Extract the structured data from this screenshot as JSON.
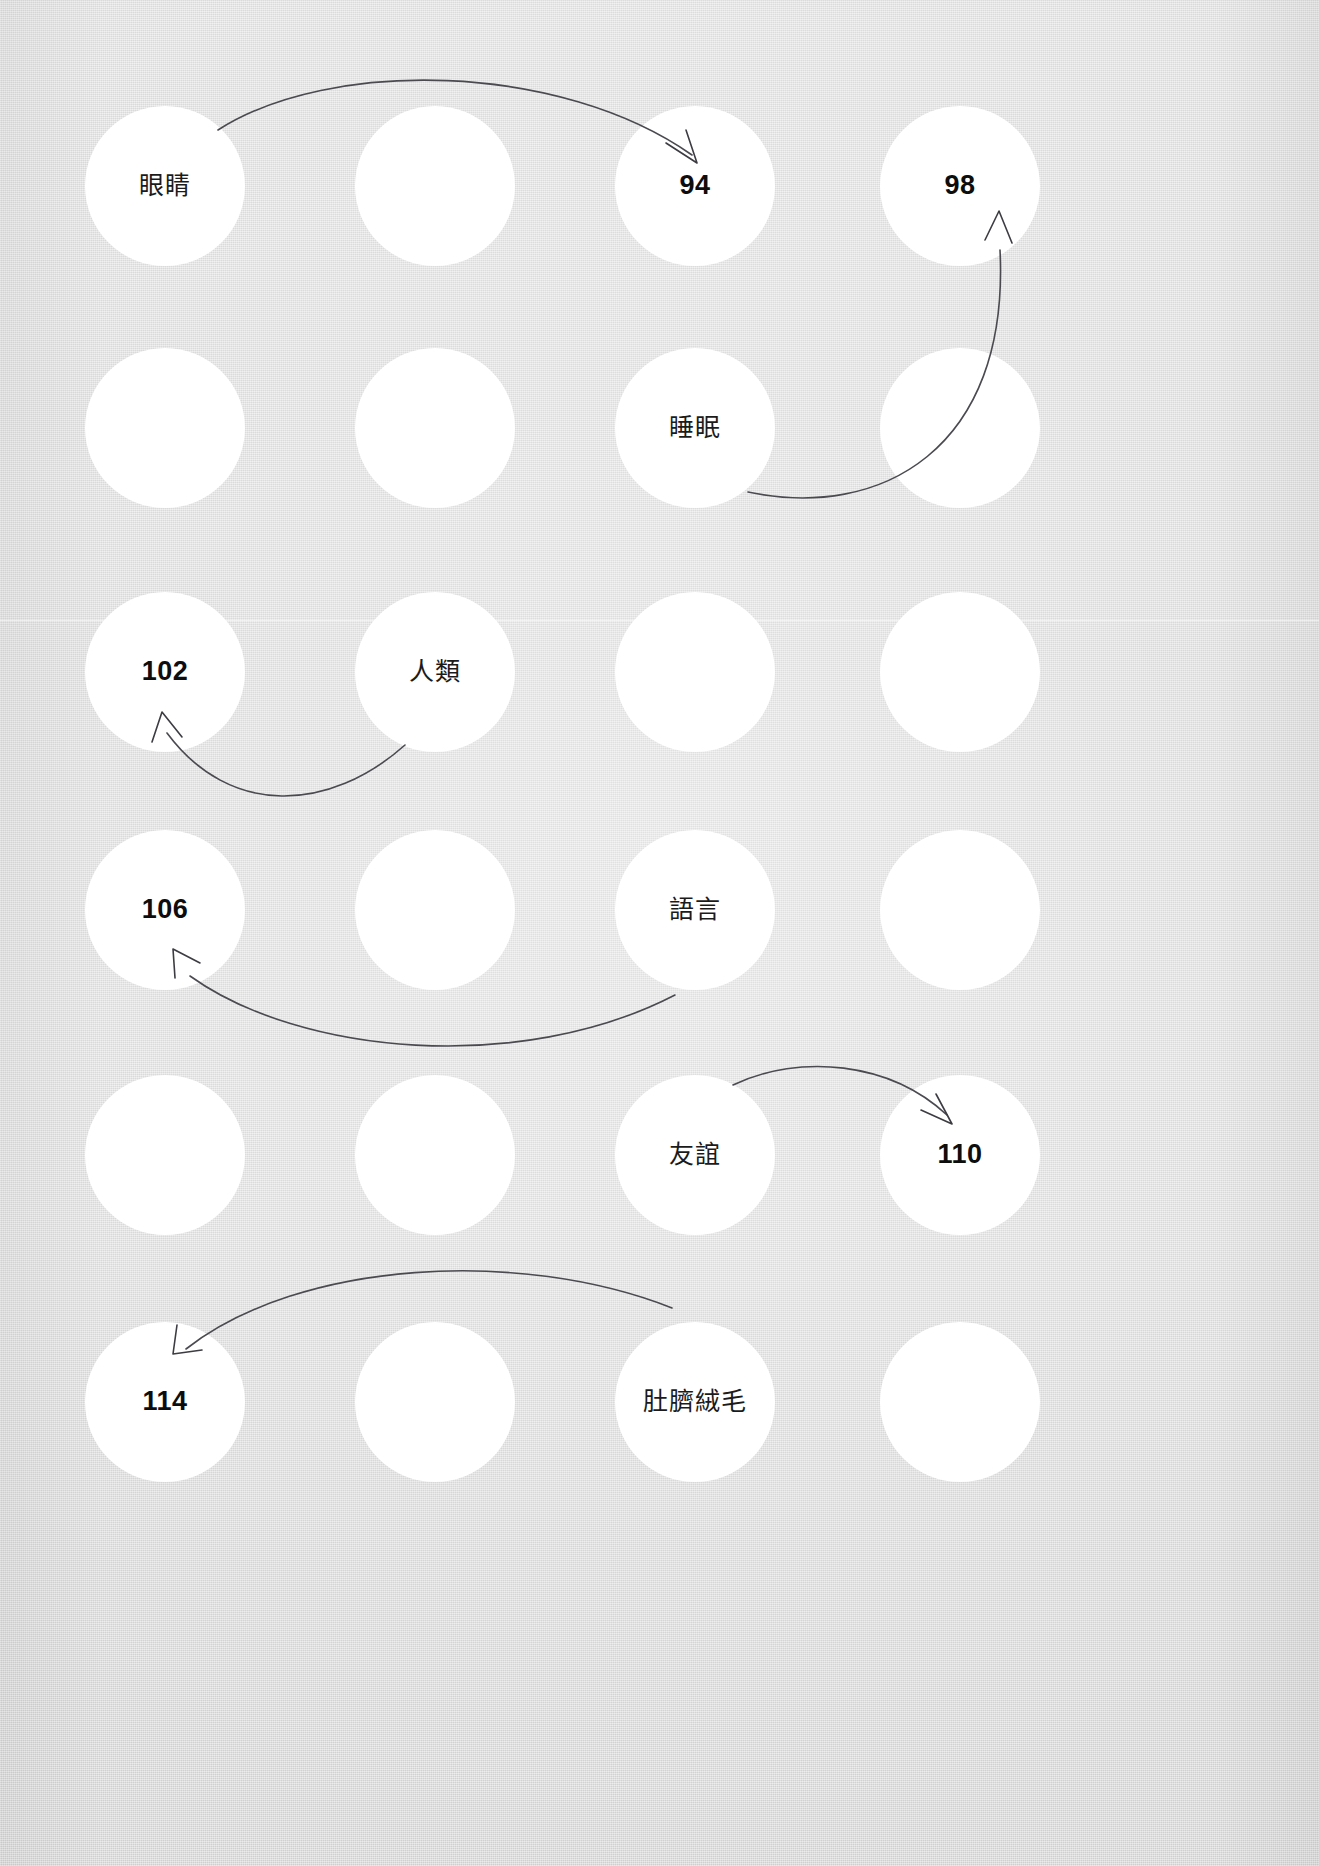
{
  "page": {
    "width": 1319,
    "height": 1866,
    "background_color": "#dcdcdc",
    "circle_color": "#ffffff",
    "text_color": "#111111",
    "arrow_color": "#4a4a50"
  },
  "grid": {
    "rows": 6,
    "columns": 4,
    "circle_diameter": 160,
    "column_centers": [
      165,
      435,
      695,
      960
    ],
    "row_centers": [
      186,
      428,
      672,
      910,
      1155,
      1402
    ]
  },
  "circles": [
    {
      "id": "r1c1",
      "row": 1,
      "col": 1,
      "cx": 165,
      "cy": 186,
      "r": 80,
      "label": "眼睛",
      "kind": "cjk"
    },
    {
      "id": "r1c2",
      "row": 1,
      "col": 2,
      "cx": 435,
      "cy": 186,
      "r": 80,
      "label": "",
      "kind": "empty"
    },
    {
      "id": "r1c3",
      "row": 1,
      "col": 3,
      "cx": 695,
      "cy": 186,
      "r": 80,
      "label": "94",
      "kind": "num"
    },
    {
      "id": "r1c4",
      "row": 1,
      "col": 4,
      "cx": 960,
      "cy": 186,
      "r": 80,
      "label": "98",
      "kind": "num"
    },
    {
      "id": "r2c1",
      "row": 2,
      "col": 1,
      "cx": 165,
      "cy": 428,
      "r": 80,
      "label": "",
      "kind": "empty"
    },
    {
      "id": "r2c2",
      "row": 2,
      "col": 2,
      "cx": 435,
      "cy": 428,
      "r": 80,
      "label": "",
      "kind": "empty"
    },
    {
      "id": "r2c3",
      "row": 2,
      "col": 3,
      "cx": 695,
      "cy": 428,
      "r": 80,
      "label": "睡眠",
      "kind": "cjk"
    },
    {
      "id": "r2c4",
      "row": 2,
      "col": 4,
      "cx": 960,
      "cy": 428,
      "r": 80,
      "label": "",
      "kind": "empty"
    },
    {
      "id": "r3c1",
      "row": 3,
      "col": 1,
      "cx": 165,
      "cy": 672,
      "r": 80,
      "label": "102",
      "kind": "num"
    },
    {
      "id": "r3c2",
      "row": 3,
      "col": 2,
      "cx": 435,
      "cy": 672,
      "r": 80,
      "label": "人類",
      "kind": "cjk"
    },
    {
      "id": "r3c3",
      "row": 3,
      "col": 3,
      "cx": 695,
      "cy": 672,
      "r": 80,
      "label": "",
      "kind": "empty"
    },
    {
      "id": "r3c4",
      "row": 3,
      "col": 4,
      "cx": 960,
      "cy": 672,
      "r": 80,
      "label": "",
      "kind": "empty"
    },
    {
      "id": "r4c1",
      "row": 4,
      "col": 1,
      "cx": 165,
      "cy": 910,
      "r": 80,
      "label": "106",
      "kind": "num"
    },
    {
      "id": "r4c2",
      "row": 4,
      "col": 2,
      "cx": 435,
      "cy": 910,
      "r": 80,
      "label": "",
      "kind": "empty"
    },
    {
      "id": "r4c3",
      "row": 4,
      "col": 3,
      "cx": 695,
      "cy": 910,
      "r": 80,
      "label": "語言",
      "kind": "cjk"
    },
    {
      "id": "r4c4",
      "row": 4,
      "col": 4,
      "cx": 960,
      "cy": 910,
      "r": 80,
      "label": "",
      "kind": "empty"
    },
    {
      "id": "r5c1",
      "row": 5,
      "col": 1,
      "cx": 165,
      "cy": 1155,
      "r": 80,
      "label": "",
      "kind": "empty"
    },
    {
      "id": "r5c2",
      "row": 5,
      "col": 2,
      "cx": 435,
      "cy": 1155,
      "r": 80,
      "label": "",
      "kind": "empty"
    },
    {
      "id": "r5c3",
      "row": 5,
      "col": 3,
      "cx": 695,
      "cy": 1155,
      "r": 80,
      "label": "友誼",
      "kind": "cjk"
    },
    {
      "id": "r5c4",
      "row": 5,
      "col": 4,
      "cx": 960,
      "cy": 1155,
      "r": 80,
      "label": "110",
      "kind": "num"
    },
    {
      "id": "r6c1",
      "row": 6,
      "col": 1,
      "cx": 165,
      "cy": 1402,
      "r": 80,
      "label": "114",
      "kind": "num"
    },
    {
      "id": "r6c2",
      "row": 6,
      "col": 2,
      "cx": 435,
      "cy": 1402,
      "r": 80,
      "label": "",
      "kind": "empty"
    },
    {
      "id": "r6c3",
      "row": 6,
      "col": 3,
      "cx": 695,
      "cy": 1402,
      "r": 80,
      "label": "肚臍絨毛",
      "kind": "cjk"
    },
    {
      "id": "r6c4",
      "row": 6,
      "col": 4,
      "cx": 960,
      "cy": 1402,
      "r": 80,
      "label": "",
      "kind": "empty"
    }
  ],
  "connections": [
    {
      "id": "a1",
      "from": "眼睛",
      "to": "94",
      "from_circle": "r1c1",
      "to_circle": "r1c3"
    },
    {
      "id": "a2",
      "from": "睡眠",
      "to": "98",
      "from_circle": "r2c3",
      "to_circle": "r1c4"
    },
    {
      "id": "a3",
      "from": "人類",
      "to": "102",
      "from_circle": "r3c2",
      "to_circle": "r3c1"
    },
    {
      "id": "a4",
      "from": "語言",
      "to": "106",
      "from_circle": "r4c3",
      "to_circle": "r4c1"
    },
    {
      "id": "a5",
      "from": "友誼",
      "to": "110",
      "from_circle": "r5c3",
      "to_circle": "r5c4"
    },
    {
      "id": "a6",
      "from": "肚臍絨毛",
      "to": "114",
      "from_circle": "r6c3",
      "to_circle": "r6c1"
    }
  ],
  "labels_summary": {
    "terms": [
      "眼睛",
      "睡眠",
      "人類",
      "語言",
      "友誼",
      "肚臍絨毛"
    ],
    "page_numbers": [
      "94",
      "98",
      "102",
      "106",
      "110",
      "114"
    ]
  }
}
